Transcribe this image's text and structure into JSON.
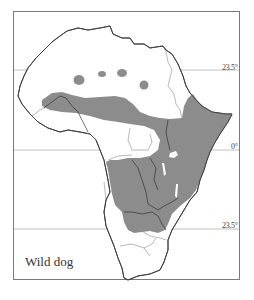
{
  "map": {
    "title": "Wild dog",
    "region": "Africa",
    "colors": {
      "range_fill": "#8c8c8c",
      "coastline": "#3a3a3a",
      "borders_in_range": "#2f2f2f",
      "borders_outside_range": "#9a9a9a",
      "gridline": "#aaaaaa",
      "frame": "#777777",
      "background": "#ffffff"
    },
    "latitude_lines": [
      {
        "label": "23.5°",
        "meaning": "Tropic of Cancer"
      },
      {
        "label": "0°",
        "meaning": "Equator"
      },
      {
        "label": "23.5°",
        "meaning": "Tropic of Capricorn"
      }
    ],
    "legend": {
      "species": "Wild dog"
    }
  }
}
